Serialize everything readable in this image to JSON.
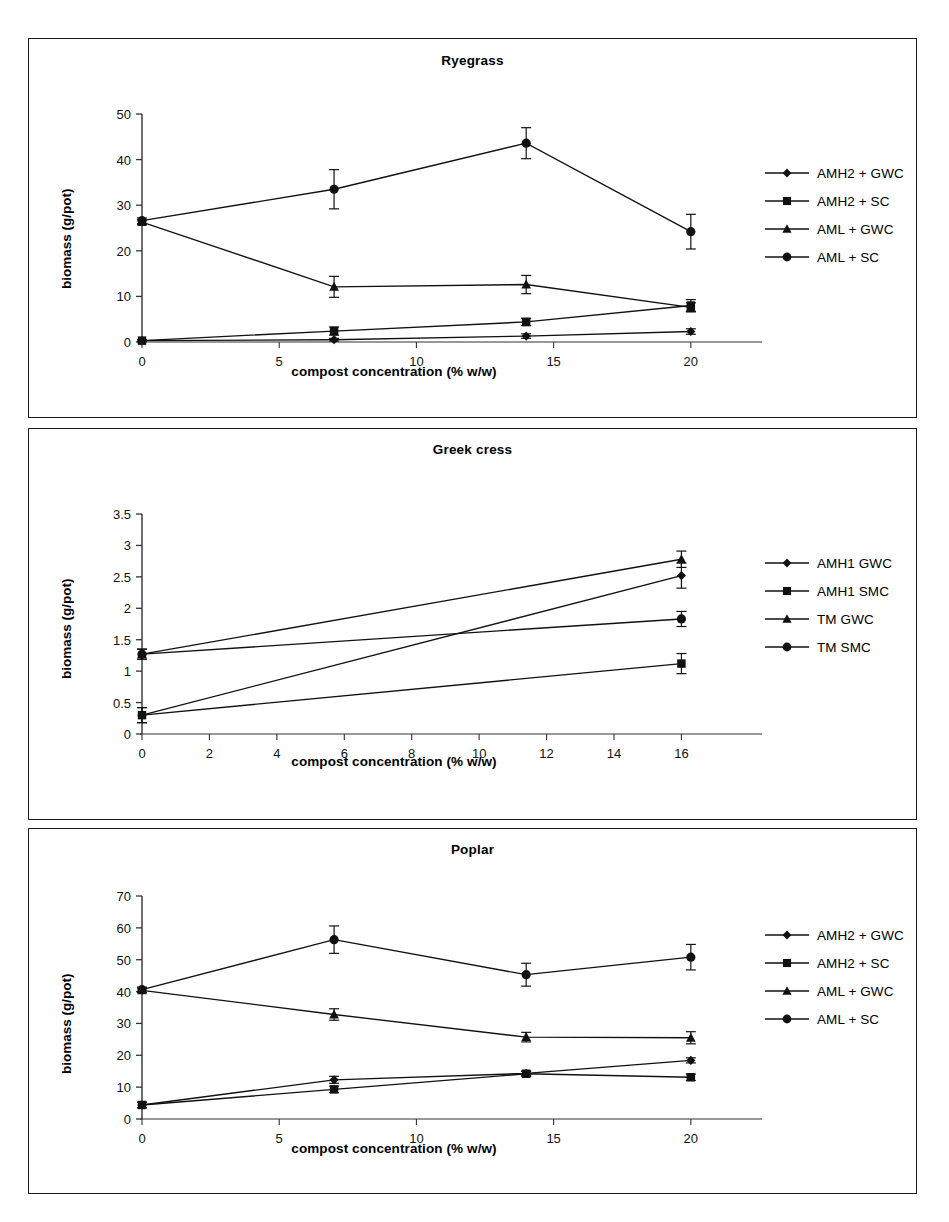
{
  "figure": {
    "y_axis_label": "biomass (g/pot)",
    "x_axis_label": "compost concentration (% w/w)"
  },
  "panels": [
    {
      "id": "ryegrass",
      "title": "Ryegrass",
      "legend": [
        {
          "label": "AMH2 + GWC",
          "marker": "diamond"
        },
        {
          "label": "AMH2 + SC",
          "marker": "square"
        },
        {
          "label": "AML + GWC",
          "marker": "triangle"
        },
        {
          "label": "AML + SC",
          "marker": "circle"
        }
      ]
    },
    {
      "id": "greekcress",
      "title": "Greek cress",
      "legend": [
        {
          "label": "AMH1 GWC",
          "marker": "diamond"
        },
        {
          "label": "AMH1 SMC",
          "marker": "square"
        },
        {
          "label": "TM GWC",
          "marker": "triangle"
        },
        {
          "label": "TM SMC",
          "marker": "circle"
        }
      ]
    },
    {
      "id": "poplar",
      "title": "Poplar",
      "legend": [
        {
          "label": "AMH2 + GWC",
          "marker": "diamond"
        },
        {
          "label": "AMH2 + SC",
          "marker": "square"
        },
        {
          "label": "AML + GWC",
          "marker": "triangle"
        },
        {
          "label": "AML + SC",
          "marker": "circle"
        }
      ]
    }
  ],
  "chart_data": [
    {
      "type": "line",
      "title": "Ryegrass",
      "xlabel": "compost concentration (% w/w)",
      "ylabel": "biomass (g/pot)",
      "x": [
        0,
        7,
        14,
        20
      ],
      "xlim": [
        0,
        21.5
      ],
      "ylim": [
        0,
        50
      ],
      "xticks": [
        0,
        5,
        10,
        15,
        20
      ],
      "yticks": [
        0,
        10,
        20,
        30,
        40,
        50
      ],
      "grid": false,
      "legend_position": "right",
      "errorbars": true,
      "series": [
        {
          "name": "AMH2 + GWC",
          "marker": "diamond",
          "values": [
            0.3,
            0.5,
            1.3,
            2.3
          ],
          "errors": [
            0.2,
            0.3,
            0.5,
            0.6
          ]
        },
        {
          "name": "AMH2 + SC",
          "marker": "square",
          "values": [
            0.3,
            2.4,
            4.4,
            8.0
          ],
          "errors": [
            0.2,
            0.9,
            0.8,
            1.3
          ]
        },
        {
          "name": "AML + GWC",
          "marker": "triangle",
          "values": [
            26.3,
            12.1,
            12.6,
            7.6
          ],
          "errors": [
            0.5,
            2.3,
            2.0,
            1.0
          ]
        },
        {
          "name": "AML + SC",
          "marker": "circle",
          "values": [
            26.6,
            33.5,
            43.6,
            24.2
          ],
          "errors": [
            0.6,
            4.3,
            3.4,
            3.8
          ]
        }
      ]
    },
    {
      "type": "line",
      "title": "Greek cress",
      "xlabel": "compost concentration (% w/w)",
      "ylabel": "biomass (g/pot)",
      "x": [
        0,
        16
      ],
      "xlim": [
        0,
        17.5
      ],
      "ylim": [
        0,
        3.5
      ],
      "xticks": [
        0,
        2,
        4,
        6,
        8,
        10,
        12,
        14,
        16
      ],
      "yticks": [
        0,
        0.5,
        1,
        1.5,
        2,
        2.5,
        3,
        3.5
      ],
      "grid": false,
      "legend_position": "right",
      "errorbars": true,
      "series": [
        {
          "name": "AMH1 GWC",
          "marker": "diamond",
          "values": [
            0.3,
            2.52
          ],
          "errors": [
            0.12,
            0.2
          ]
        },
        {
          "name": "AMH1 SMC",
          "marker": "square",
          "values": [
            0.3,
            1.12
          ],
          "errors": [
            0.12,
            0.16
          ]
        },
        {
          "name": "TM GWC",
          "marker": "triangle",
          "values": [
            1.27,
            2.78
          ],
          "errors": [
            0.08,
            0.13
          ]
        },
        {
          "name": "TM SMC",
          "marker": "circle",
          "values": [
            1.27,
            1.83
          ],
          "errors": [
            0.08,
            0.12
          ]
        }
      ]
    },
    {
      "type": "line",
      "title": "Poplar",
      "xlabel": "compost concentration (% w/w)",
      "ylabel": "biomass (g/pot)",
      "x": [
        0,
        7,
        14,
        20
      ],
      "xlim": [
        0,
        21.5
      ],
      "ylim": [
        0,
        70
      ],
      "xticks": [
        0,
        5,
        10,
        15,
        20
      ],
      "yticks": [
        0,
        10,
        20,
        30,
        40,
        50,
        60,
        70
      ],
      "grid": false,
      "legend_position": "right",
      "errorbars": true,
      "series": [
        {
          "name": "AMH2 + GWC",
          "marker": "diamond",
          "values": [
            4.4,
            12.3,
            14.3,
            18.4
          ],
          "errors": [
            0.8,
            1.1,
            0.7,
            0.8
          ]
        },
        {
          "name": "AMH2 + SC",
          "marker": "square",
          "values": [
            4.4,
            9.3,
            14.2,
            13.1
          ],
          "errors": [
            0.9,
            1.0,
            0.8,
            1.0
          ]
        },
        {
          "name": "AML + GWC",
          "marker": "triangle",
          "values": [
            40.4,
            32.8,
            25.7,
            25.5
          ],
          "errors": [
            0.7,
            1.8,
            1.5,
            1.9
          ]
        },
        {
          "name": "AML + SC",
          "marker": "circle",
          "values": [
            40.6,
            56.3,
            45.3,
            50.8
          ],
          "errors": [
            0.8,
            4.3,
            3.6,
            4.0
          ]
        }
      ]
    }
  ]
}
